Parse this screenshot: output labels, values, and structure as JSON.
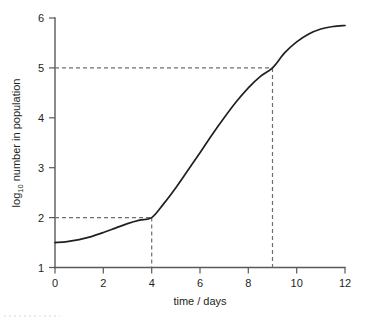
{
  "chart_data": {
    "type": "line",
    "title": "",
    "xlabel": "time / days",
    "ylabel_main": "number in population",
    "ylabel_prefix": "log",
    "ylabel_subscript": "10",
    "ylabel_full": "log10 number in population",
    "xlim": [
      0,
      12
    ],
    "ylim": [
      1,
      6
    ],
    "xticks": [
      0,
      2,
      4,
      6,
      8,
      10,
      12
    ],
    "xtick_labels": [
      "0",
      "2",
      "4",
      "6",
      "8",
      "10",
      "12"
    ],
    "yticks": [
      1,
      2,
      3,
      4,
      5,
      6
    ],
    "ytick_labels": [
      "1",
      "2",
      "3",
      "4",
      "5",
      "6"
    ],
    "grid": false,
    "legend": null,
    "series": [
      {
        "name": "population growth",
        "color": "#231f20",
        "x": [
          0,
          0.5,
          1,
          1.5,
          2,
          2.5,
          3,
          3.5,
          4,
          4.5,
          5,
          5.5,
          6,
          6.5,
          7,
          7.5,
          8,
          8.5,
          9,
          9.5,
          10,
          10.5,
          11,
          11.5,
          12
        ],
        "y": [
          1.5,
          1.52,
          1.56,
          1.62,
          1.7,
          1.79,
          1.88,
          1.95,
          2.0,
          2.28,
          2.6,
          2.95,
          3.3,
          3.66,
          4.0,
          4.32,
          4.6,
          4.83,
          5.0,
          5.3,
          5.52,
          5.68,
          5.78,
          5.83,
          5.85
        ]
      }
    ],
    "annotations": [
      {
        "name": "guide-lower",
        "x_value": 4,
        "y_value": 2,
        "style": "dashed",
        "color": "#6d6e71",
        "description": "dashed guide lines from y = 2 across to curve and down to t = 4"
      },
      {
        "name": "guide-upper",
        "x_value": 9,
        "y_value": 5,
        "style": "dashed",
        "color": "#6d6e71",
        "description": "dashed guide lines from y = 5 across to curve and down to t = 9"
      }
    ],
    "axis_color": "#58595b",
    "background_color": "#ffffff"
  }
}
